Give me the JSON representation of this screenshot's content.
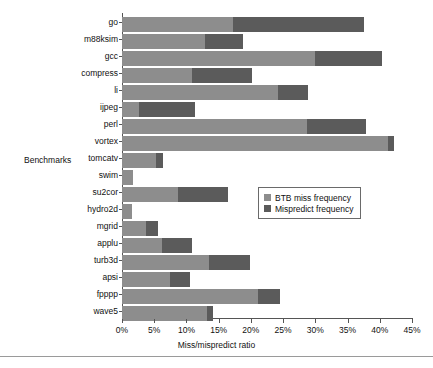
{
  "chart_data": {
    "type": "bar",
    "orientation": "horizontal",
    "stacked": true,
    "title": "",
    "xlabel": "Miss/mispredict ratio",
    "ylabel": "Benchmarks",
    "xlim": [
      0,
      45
    ],
    "xtick_labels": [
      "0%",
      "5%",
      "10%",
      "15%",
      "20%",
      "25%",
      "30%",
      "35%",
      "40%",
      "45%"
    ],
    "xtick_values": [
      0,
      5,
      10,
      15,
      20,
      25,
      30,
      35,
      40,
      45
    ],
    "grid": false,
    "legend_position": "center-right-inside",
    "categories": [
      "go",
      "m88ksim",
      "gcc",
      "compress",
      "li",
      "ijpeg",
      "perl",
      "vortex",
      "tomcatv",
      "swim",
      "su2cor",
      "hydro2d",
      "mgrid",
      "applu",
      "turb3d",
      "apsi",
      "fpppp",
      "wave5"
    ],
    "series": [
      {
        "name": "BTB miss frequency",
        "color": "#8d8d8d",
        "values": [
          17.2,
          12.9,
          30.0,
          10.9,
          24.2,
          2.6,
          28.7,
          41.3,
          5.3,
          1.7,
          8.7,
          1.6,
          3.7,
          6.2,
          13.5,
          7.4,
          21.1,
          13.2
        ]
      },
      {
        "name": "Mispredict frequency",
        "color": "#5b5b5b",
        "values": [
          20.3,
          5.8,
          10.4,
          9.3,
          4.7,
          8.8,
          9.2,
          0.9,
          1.1,
          0.0,
          7.8,
          0.0,
          1.9,
          4.7,
          6.4,
          3.1,
          3.4,
          0.9
        ]
      }
    ],
    "totals": [
      37.5,
      18.7,
      40.4,
      20.2,
      28.9,
      11.4,
      37.9,
      42.2,
      6.4,
      1.7,
      16.5,
      1.6,
      5.6,
      10.9,
      19.9,
      10.5,
      24.5,
      14.1
    ]
  },
  "legend": {
    "items": [
      {
        "label": "BTB miss frequency",
        "color": "#8d8d8d"
      },
      {
        "label": "Mispredict frequency",
        "color": "#5b5b5b"
      }
    ]
  }
}
